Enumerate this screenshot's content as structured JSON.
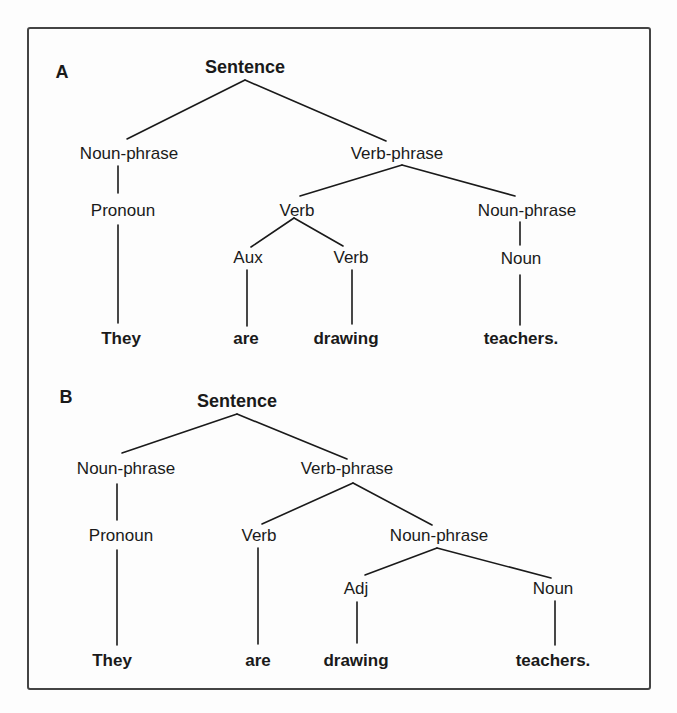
{
  "colors": {
    "line": "#1a1a1a",
    "text": "#1a1a1a",
    "border": "#444444",
    "background": "#fdfdfd"
  },
  "panels": [
    {
      "label": "A",
      "sentence": "They are drawing teachers.",
      "nodes": {
        "root": "Sentence",
        "np": "Noun-phrase",
        "vp": "Verb-phrase",
        "pronoun": "Pronoun",
        "verb_group": "Verb",
        "np2": "Noun-phrase",
        "aux": "Aux",
        "verb": "Verb",
        "noun": "Noun"
      },
      "words": [
        "They",
        "are",
        "drawing",
        "teachers."
      ]
    },
    {
      "label": "B",
      "sentence": "They are drawing teachers.",
      "nodes": {
        "root": "Sentence",
        "np": "Noun-phrase",
        "vp": "Verb-phrase",
        "pronoun": "Pronoun",
        "verb": "Verb",
        "np2": "Noun-phrase",
        "adj": "Adj",
        "noun": "Noun"
      },
      "words": [
        "They",
        "are",
        "drawing",
        "teachers."
      ]
    }
  ]
}
